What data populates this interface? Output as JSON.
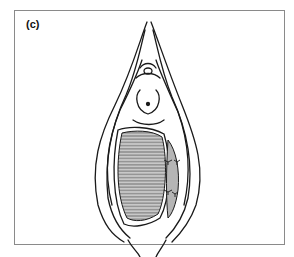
{
  "figure": {
    "panel_label": "(c)",
    "colors": {
      "line": "#1a1a1a",
      "frame": "#8a8a8a",
      "shaded_fill": "#bdbdbd",
      "background": "#ffffff"
    }
  }
}
